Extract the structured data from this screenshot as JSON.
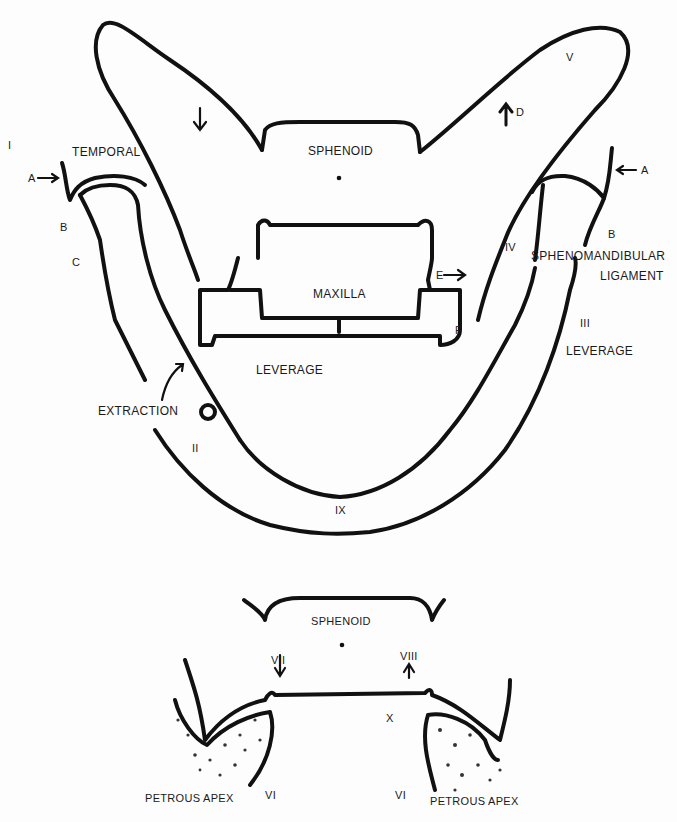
{
  "diagram": {
    "type": "anatomical line drawing",
    "stroke_color": "#111111",
    "background_color": "#fdfdfd",
    "top_figure": {
      "bones": {
        "sphenoid": "SPHENOID",
        "temporal": "TEMPORAL",
        "maxilla": "MAXILLA"
      },
      "ligament": {
        "line1": "SPHENOMANDIBULAR",
        "line2": "LIGAMENT"
      },
      "annotations": {
        "extraction": "EXTRACTION",
        "leverage_center": "LEVERAGE",
        "leverage_right": "LEVERAGE"
      },
      "roman_numerals": {
        "I": "I",
        "II": "II",
        "III": "III",
        "IV": "IV",
        "V": "V",
        "IX": "IX"
      },
      "letters": {
        "A_left": "A",
        "B_left": "B",
        "C_left": "C",
        "A_right": "A",
        "B_right": "B",
        "D": "D",
        "E": "E",
        "F": "F"
      }
    },
    "bottom_figure": {
      "bones": {
        "sphenoid": "SPHENOID",
        "petrous_left": "PETROUS APEX",
        "petrous_right": "PETROUS APEX"
      },
      "roman_numerals": {
        "VI_left": "VI",
        "VI_right": "VI",
        "VII": "VII",
        "VIII": "VIII",
        "X": "X"
      }
    }
  }
}
